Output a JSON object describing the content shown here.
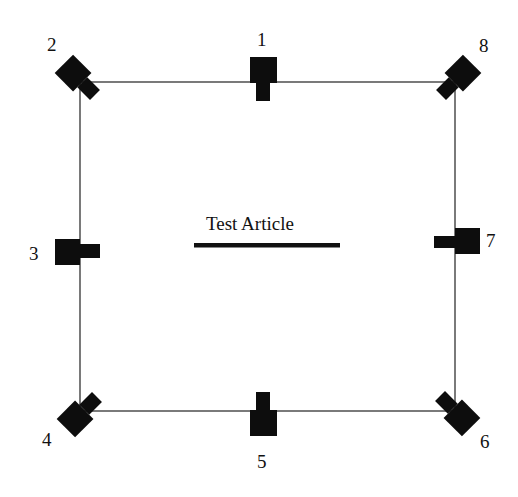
{
  "diagram": {
    "test_article_label": "Test Article",
    "frame_color": "#333333",
    "camera_color": "#0d0d0d",
    "cameras": [
      {
        "id": "1",
        "label": "1",
        "position": "top-center",
        "facing": "down"
      },
      {
        "id": "2",
        "label": "2",
        "position": "top-left",
        "facing": "down-right"
      },
      {
        "id": "3",
        "label": "3",
        "position": "middle-left",
        "facing": "right"
      },
      {
        "id": "4",
        "label": "4",
        "position": "bottom-left",
        "facing": "up-right"
      },
      {
        "id": "5",
        "label": "5",
        "position": "bottom-center",
        "facing": "up"
      },
      {
        "id": "6",
        "label": "6",
        "position": "bottom-right",
        "facing": "up-left"
      },
      {
        "id": "7",
        "label": "7",
        "position": "middle-right",
        "facing": "left"
      },
      {
        "id": "8",
        "label": "8",
        "position": "top-right",
        "facing": "down-left"
      }
    ]
  }
}
